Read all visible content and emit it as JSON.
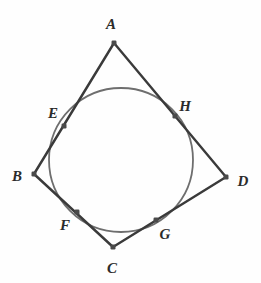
{
  "figure": {
    "background_color": "#fefefe",
    "line_color": "#3a3a3a",
    "circle_color": "#6e6e6e",
    "point_color": "#4a4a4a",
    "label_color": "#2b2b2b",
    "line_width": 2.4,
    "circle_width": 1.8,
    "point_size": 5
  },
  "chart_data": {
    "type": "scatter",
    "xlabel": "",
    "ylabel": "",
    "circle": {
      "cx": 121,
      "cy": 160,
      "r": 72
    },
    "vertices": [
      {
        "name": "A",
        "x": 114,
        "y": 43
      },
      {
        "name": "B",
        "x": 34,
        "y": 174
      },
      {
        "name": "C",
        "x": 113,
        "y": 247
      },
      {
        "name": "D",
        "x": 226,
        "y": 177
      }
    ],
    "tangent_points": [
      {
        "name": "E",
        "x": 64,
        "y": 126
      },
      {
        "name": "F",
        "x": 77,
        "y": 212
      },
      {
        "name": "G",
        "x": 156,
        "y": 220
      },
      {
        "name": "H",
        "x": 175,
        "y": 116
      }
    ],
    "edges": [
      {
        "from": "A",
        "to": "B",
        "tangent_at": "E"
      },
      {
        "from": "B",
        "to": "C",
        "tangent_at": "F"
      },
      {
        "from": "C",
        "to": "D",
        "tangent_at": "G"
      },
      {
        "from": "D",
        "to": "A",
        "tangent_at": "H"
      }
    ]
  },
  "labels": [
    {
      "text": "A",
      "x": 111,
      "y": 24
    },
    {
      "text": "B",
      "x": 17,
      "y": 176
    },
    {
      "text": "C",
      "x": 112,
      "y": 268
    },
    {
      "text": "D",
      "x": 243,
      "y": 181
    },
    {
      "text": "E",
      "x": 53,
      "y": 113
    },
    {
      "text": "F",
      "x": 65,
      "y": 225
    },
    {
      "text": "G",
      "x": 165,
      "y": 234
    },
    {
      "text": "H",
      "x": 185,
      "y": 106
    }
  ]
}
